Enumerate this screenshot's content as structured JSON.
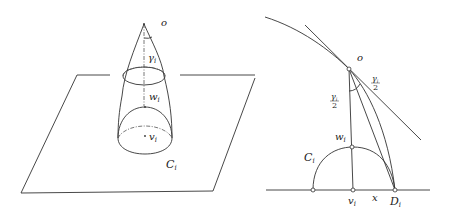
{
  "figure": {
    "left_panel": {
      "description": "3D cone-like surface with apex o standing on a plane; caps shown as ellipses",
      "labels": {
        "apex": "o",
        "angle": "γ",
        "angle_sub": "i",
        "top_point": "w",
        "top_point_sub": "i",
        "base_point": "v",
        "base_point_sub": "i",
        "region": "C",
        "region_sub": "i"
      }
    },
    "right_panel": {
      "description": "2D cross-section: arc through o tangent line, vertical segment o–v_i, semicircle C_i centered at v_i, point D_i on baseline",
      "labels": {
        "apex": "o",
        "half_angle_num_left": "γ",
        "half_angle_num_left_sub": "i",
        "half_angle_den_left": "2",
        "half_angle_num_right": "γ",
        "half_angle_num_right_sub": "i",
        "half_angle_den_right": "2",
        "top_point": "w",
        "top_point_sub": "i",
        "base_point": "v",
        "base_point_sub": "i",
        "distance": "x",
        "endpoint": "D",
        "endpoint_sub": "i",
        "region": "C",
        "region_sub": "i"
      }
    }
  }
}
